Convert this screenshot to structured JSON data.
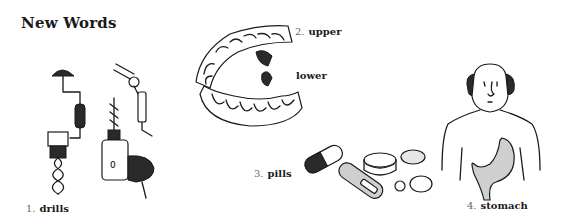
{
  "page": {
    "title": "New Words"
  },
  "items": [
    {
      "number": "1.",
      "word": "drills",
      "icon": "drills-illustration"
    },
    {
      "number": "2.",
      "word": "upper",
      "icon": "teeth-illustration"
    },
    {
      "number": "",
      "word": "lower",
      "icon": "teeth-illustration"
    },
    {
      "number": "3.",
      "word": "pills",
      "icon": "pills-illustration"
    },
    {
      "number": "4.",
      "word": "stomach",
      "icon": "stomach-illustration"
    }
  ]
}
